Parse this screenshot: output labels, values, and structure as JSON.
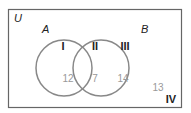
{
  "diagram": {
    "type": "venn",
    "universe_label": "U",
    "sets": [
      {
        "name": "A",
        "circle": {
          "cx": 64,
          "cy": 68,
          "r": 28
        }
      },
      {
        "name": "B",
        "circle": {
          "cx": 101,
          "cy": 68,
          "r": 28
        }
      }
    ],
    "regions": [
      {
        "roman": "I",
        "description": "A only",
        "count": "12"
      },
      {
        "roman": "II",
        "description": "A and B",
        "count": "7"
      },
      {
        "roman": "III",
        "description": "B only",
        "count": "14"
      },
      {
        "roman": "IV",
        "description": "neither",
        "count": "13"
      }
    ],
    "colors": {
      "border": "#666666",
      "circle": "#888888",
      "count_text": "#999999",
      "label_text": "#222222"
    }
  }
}
